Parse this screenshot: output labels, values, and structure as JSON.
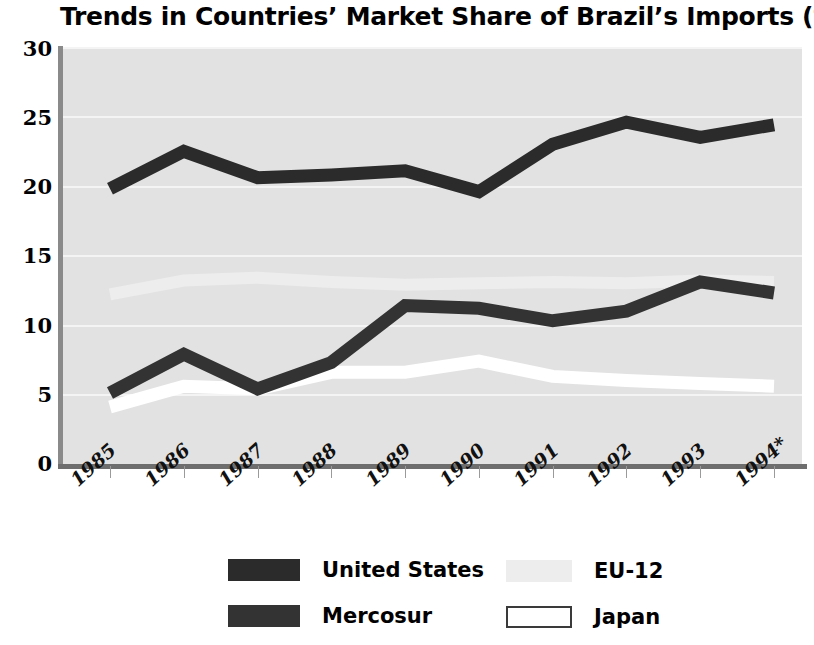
{
  "chart_data": {
    "type": "line",
    "title": "Trends in Countries’ Market Share of Brazil’s Imports (%)",
    "xlabel": "",
    "ylabel": "",
    "categories": [
      "1985",
      "1986",
      "1987",
      "1988",
      "1989",
      "1990",
      "1991",
      "1992",
      "1993",
      "1994*"
    ],
    "ylim": [
      0,
      30
    ],
    "yticks": [
      0,
      5,
      10,
      15,
      20,
      25,
      30
    ],
    "grid": true,
    "legend_position": "bottom",
    "series": [
      {
        "name": "United States",
        "color": "#2b2b2b",
        "values": [
          19.8,
          22.5,
          20.6,
          20.8,
          21.1,
          19.6,
          23.0,
          24.6,
          23.5,
          24.4
        ]
      },
      {
        "name": "Mercosur",
        "color": "#2b2b2b",
        "values": [
          5.1,
          7.9,
          5.4,
          7.3,
          11.4,
          11.2,
          10.3,
          11.0,
          13.1,
          12.3
        ]
      },
      {
        "name": "EU-12",
        "color": "#ededed",
        "values": [
          12.2,
          13.2,
          13.4,
          13.1,
          12.9,
          13.0,
          13.1,
          13.0,
          13.2,
          13.1
        ]
      },
      {
        "name": "Japan",
        "color": "#ffffff",
        "values": [
          4.1,
          5.6,
          5.4,
          6.6,
          6.6,
          7.4,
          6.3,
          6.0,
          5.8,
          5.6
        ]
      }
    ]
  },
  "legend": {
    "items": [
      {
        "label": "United States",
        "swatch": "dark",
        "color": "#2b2b2b"
      },
      {
        "label": "Mercosur",
        "swatch": "dark",
        "color": "#333333"
      },
      {
        "label": "EU-12",
        "swatch": "light",
        "color": "#ededed"
      },
      {
        "label": "Japan",
        "swatch": "white",
        "color": "#ffffff"
      }
    ]
  },
  "axes": {
    "y_tick_labels": [
      "30",
      "25",
      "20",
      "15",
      "10",
      "5",
      "0"
    ],
    "x_tick_labels": [
      "1985",
      "1986",
      "1987",
      "1988",
      "1989",
      "1990",
      "1991",
      "1992",
      "1993",
      "1994*"
    ]
  },
  "colors": {
    "plot_background": "#e2e2e2",
    "gridline": "#f4f4f4",
    "axis": "#777777",
    "text": "#000000"
  }
}
